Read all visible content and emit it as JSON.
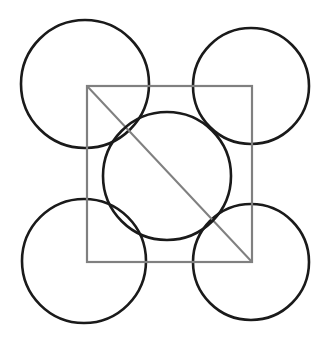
{
  "canvas": {
    "width": 327,
    "height": 343,
    "background_color": "#ffffff",
    "title": "Four corner circles with inscribed square, central circle and diagonal"
  },
  "style": {
    "circle_stroke_color": "#1a1a1a",
    "circle_stroke_width": 2.6,
    "square_stroke_color": "#808080",
    "square_stroke_width": 2.2,
    "diagonal_stroke_color": "#808080",
    "diagonal_stroke_width": 2.0
  },
  "shapes": {
    "square": {
      "label": "central-square",
      "x": 87,
      "y": 86,
      "width": 165,
      "height": 176,
      "left": 87,
      "top": 86,
      "right": 252,
      "bottom": 262
    },
    "diagonal": {
      "label": "square-diagonal",
      "x1": 87,
      "y1": 86,
      "x2": 252,
      "y2": 262
    },
    "center_circle": {
      "label": "center-circle",
      "cx": 167,
      "cy": 176,
      "r": 64
    },
    "corner_circles": [
      {
        "label": "top-left-circle",
        "cx": 85,
        "cy": 84,
        "r": 64
      },
      {
        "label": "top-right-circle",
        "cx": 251,
        "cy": 86,
        "r": 58
      },
      {
        "label": "bottom-left-circle",
        "cx": 84,
        "cy": 261,
        "r": 62
      },
      {
        "label": "bottom-right-circle",
        "cx": 251,
        "cy": 262,
        "r": 58
      }
    ]
  },
  "chart_data": {
    "type": "scatter",
    "xlabel": "",
    "ylabel": "",
    "xlim": [
      0,
      327
    ],
    "ylim": [
      0,
      343
    ],
    "grid": false,
    "legend": "none",
    "annotations": [],
    "series": [
      {
        "name": "corner-circle-centers",
        "x": [
          85,
          251,
          84,
          251
        ],
        "y": [
          84,
          86,
          261,
          262
        ],
        "radii": [
          64,
          58,
          62,
          58
        ]
      },
      {
        "name": "center-circle",
        "x": [
          167
        ],
        "y": [
          176
        ],
        "radii": [
          64
        ]
      },
      {
        "name": "square-corners",
        "x": [
          87,
          252,
          252,
          87
        ],
        "y": [
          86,
          86,
          262,
          262
        ],
        "radii": [
          0,
          0,
          0,
          0
        ]
      }
    ]
  }
}
